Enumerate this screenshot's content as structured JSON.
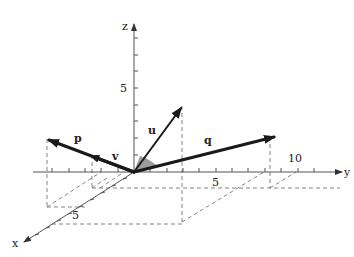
{
  "figure": {
    "type": "3d-vector-diagram",
    "axes": {
      "x": {
        "label": "x",
        "tick_labels": [
          {
            "value": 5,
            "text": "5"
          }
        ]
      },
      "y": {
        "label": "y",
        "tick_labels": [
          {
            "value": 5,
            "text": "5"
          },
          {
            "value": 10,
            "text": "10"
          }
        ]
      },
      "z": {
        "label": "z",
        "tick_labels": [
          {
            "value": 5,
            "text": "5"
          }
        ]
      }
    },
    "vectors": [
      {
        "name": "p",
        "label": "p",
        "weight": "thick"
      },
      {
        "name": "v",
        "label": "v",
        "weight": "thick"
      },
      {
        "name": "u",
        "label": "u",
        "weight": "medium"
      },
      {
        "name": "q",
        "label": "q",
        "weight": "thick"
      }
    ],
    "annotations": {
      "angle_marker": "shaded-angle-between-u-and-q",
      "projection_lines": "dashed"
    },
    "colors": {
      "axis": "#555555",
      "vector": "#1a1a1a",
      "dashed": "#666666",
      "angle_fill": "#8c8c8c",
      "background": "#ffffff"
    }
  }
}
